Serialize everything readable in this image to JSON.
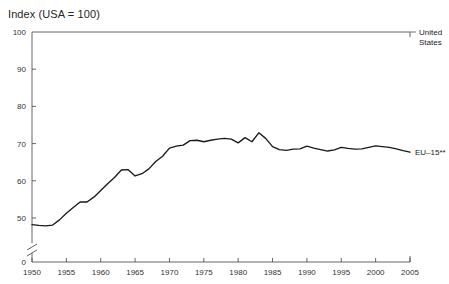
{
  "chart_data": {
    "type": "line",
    "title": "Index (USA = 100)",
    "xlabel": "",
    "ylabel": "",
    "xlim": [
      1950,
      2005
    ],
    "ylim": [
      45,
      100
    ],
    "grid": false,
    "legend_position": "right-inline-labels",
    "y_axis_break": true,
    "y_axis_break_value": 0,
    "yticks": [
      "100",
      "90",
      "80",
      "70",
      "60",
      "50",
      "0"
    ],
    "ytick_values": [
      100,
      90,
      80,
      70,
      60,
      50,
      0
    ],
    "xticks": [
      "1950",
      "1955",
      "1960",
      "1965",
      "1970",
      "1975",
      "1980",
      "1985",
      "1990",
      "1995",
      "2000",
      "2005"
    ],
    "xtick_values": [
      1950,
      1955,
      1960,
      1965,
      1970,
      1975,
      1980,
      1985,
      1990,
      1995,
      2000,
      2005
    ],
    "annotations": [
      {
        "text": "United States",
        "value": 100,
        "year": 2005
      },
      {
        "text": "EU–15**",
        "value": 68,
        "year": 2005
      }
    ],
    "series": [
      {
        "name": "United States",
        "note": "reference line at index 100 (top axis)",
        "constant_value": 100,
        "label": "United States"
      },
      {
        "name": "EU–15**",
        "label": "EU–15**",
        "color": "#1a1a1a",
        "x": [
          1950,
          1951,
          1952,
          1953,
          1954,
          1955,
          1956,
          1957,
          1958,
          1959,
          1960,
          1961,
          1962,
          1963,
          1964,
          1965,
          1966,
          1967,
          1968,
          1969,
          1970,
          1971,
          1972,
          1973,
          1974,
          1975,
          1976,
          1977,
          1978,
          1979,
          1980,
          1981,
          1982,
          1983,
          1984,
          1985,
          1986,
          1987,
          1988,
          1989,
          1990,
          1991,
          1992,
          1993,
          1994,
          1995,
          1996,
          1997,
          1998,
          1999,
          2000,
          2001,
          2002,
          2003,
          2004,
          2005
        ],
        "values": [
          48.2,
          48.0,
          47.9,
          48.1,
          49.5,
          51.3,
          52.8,
          54.3,
          54.3,
          55.6,
          57.4,
          59.2,
          60.9,
          62.9,
          63.0,
          61.3,
          61.9,
          63.2,
          65.2,
          66.6,
          68.8,
          69.3,
          69.6,
          70.8,
          70.9,
          70.5,
          70.9,
          71.2,
          71.4,
          71.2,
          70.2,
          71.6,
          70.5,
          72.9,
          71.4,
          69.2,
          68.4,
          68.2,
          68.5,
          68.6,
          69.3,
          68.8,
          68.4,
          68.0,
          68.3,
          69.0,
          68.7,
          68.5,
          68.6,
          69.0,
          69.4,
          69.2,
          69.0,
          68.6,
          68.1,
          67.7
        ]
      }
    ]
  }
}
